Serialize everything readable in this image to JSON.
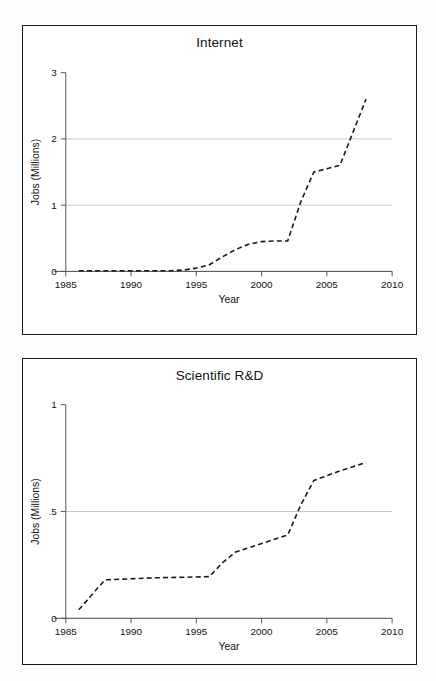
{
  "figure": {
    "background_color": "#fdfdfd",
    "panel_border_color": "#1a1a1a",
    "gridline_color": "#c9c9c9",
    "series_color": "#1a1a1a",
    "axis_title_x": "Year",
    "axis_title_y": "Jobs (Millions)"
  },
  "panels": [
    {
      "id": "internet",
      "title": "Internet"
    },
    {
      "id": "rnd",
      "title": "Scientific R&D"
    }
  ],
  "chart_data": [
    {
      "type": "line",
      "title": "Internet",
      "xlabel": "Year",
      "ylabel": "Jobs (Millions)",
      "xlim": [
        1985,
        2010
      ],
      "ylim": [
        0,
        3
      ],
      "xticks": [
        1985,
        1990,
        1995,
        2000,
        2005,
        2010
      ],
      "xticklabels": [
        "1985",
        "1990",
        "1995",
        "2000",
        "2005",
        "2010"
      ],
      "yticks": [
        0,
        1,
        2,
        3
      ],
      "yticklabels": [
        "0",
        "1",
        "2",
        "3"
      ],
      "grid": "horizontal",
      "gridlines_y": [
        0,
        1,
        2
      ],
      "linestyle": "dashed",
      "legend": "none",
      "x": [
        1986,
        1988,
        1990,
        1992,
        1993,
        1994,
        1995,
        1996,
        1997,
        1998,
        1999,
        2000,
        2001,
        2002,
        2003,
        2004,
        2005,
        2006,
        2007,
        2008
      ],
      "values": [
        0.01,
        0.01,
        0.01,
        0.01,
        0.01,
        0.02,
        0.05,
        0.1,
        0.22,
        0.33,
        0.41,
        0.45,
        0.46,
        0.46,
        1.05,
        1.5,
        1.55,
        1.6,
        2.1,
        2.6
      ]
    },
    {
      "type": "line",
      "title": "Scientific R&D",
      "xlabel": "Year",
      "ylabel": "Jobs (Millions)",
      "xlim": [
        1985,
        2010
      ],
      "ylim": [
        0,
        1
      ],
      "xticks": [
        1985,
        1990,
        1995,
        2000,
        2005,
        2010
      ],
      "xticklabels": [
        "1985",
        "1990",
        "1995",
        "2000",
        "2005",
        "2010"
      ],
      "yticks": [
        0,
        0.5,
        1
      ],
      "yticklabels": [
        "0",
        ".5",
        "1"
      ],
      "grid": "horizontal",
      "gridlines_y": [
        0,
        0.5
      ],
      "linestyle": "dashed",
      "legend": "none",
      "x": [
        1986,
        1987,
        1988,
        1990,
        1992,
        1994,
        1996,
        1997,
        1998,
        2000,
        2002,
        2003,
        2004,
        2006,
        2008
      ],
      "values": [
        0.04,
        0.11,
        0.18,
        0.185,
        0.19,
        0.192,
        0.195,
        0.26,
        0.31,
        0.35,
        0.39,
        0.53,
        0.645,
        0.69,
        0.73
      ]
    }
  ]
}
